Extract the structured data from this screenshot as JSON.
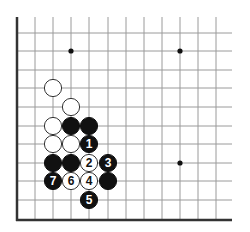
{
  "diagram": {
    "colors": {
      "background": "#ffffff",
      "grid_line": "#9a9a9a",
      "edge_line": "#333333",
      "black_stone": "#111111",
      "white_stone": "#ffffff",
      "white_stone_border": "#333333"
    },
    "grid": {
      "columns_x": [
        17,
        35,
        53,
        71,
        89,
        108,
        126,
        144,
        162,
        180,
        198,
        216
      ],
      "rows_y": [
        33,
        51,
        70,
        88,
        107,
        126,
        144,
        163,
        181,
        200,
        220
      ],
      "left_edge_x": 17,
      "bottom_edge_y": 220,
      "top_y": 17,
      "right_x": 232
    },
    "star_points": [
      {
        "x": 71,
        "y": 51
      },
      {
        "x": 180,
        "y": 51
      },
      {
        "x": 180,
        "y": 163
      }
    ],
    "stones": [
      {
        "color": "white",
        "x": 53,
        "y": 88,
        "label": ""
      },
      {
        "color": "white",
        "x": 71,
        "y": 107,
        "label": ""
      },
      {
        "color": "white",
        "x": 53,
        "y": 126,
        "label": ""
      },
      {
        "color": "black",
        "x": 71,
        "y": 126,
        "label": ""
      },
      {
        "color": "black",
        "x": 89,
        "y": 126,
        "label": ""
      },
      {
        "color": "white",
        "x": 53,
        "y": 144,
        "label": ""
      },
      {
        "color": "white",
        "x": 71,
        "y": 144,
        "label": ""
      },
      {
        "color": "black",
        "x": 89,
        "y": 144,
        "label": "1"
      },
      {
        "color": "black",
        "x": 53,
        "y": 163,
        "label": ""
      },
      {
        "color": "black",
        "x": 71,
        "y": 163,
        "label": ""
      },
      {
        "color": "white",
        "x": 89,
        "y": 163,
        "label": "2"
      },
      {
        "color": "black",
        "x": 108,
        "y": 163,
        "label": "3"
      },
      {
        "color": "black",
        "x": 53,
        "y": 181,
        "label": "7"
      },
      {
        "color": "white",
        "x": 71,
        "y": 181,
        "label": "6"
      },
      {
        "color": "white",
        "x": 89,
        "y": 181,
        "label": "4"
      },
      {
        "color": "black",
        "x": 108,
        "y": 181,
        "label": ""
      },
      {
        "color": "black",
        "x": 89,
        "y": 200,
        "label": "5"
      }
    ]
  }
}
